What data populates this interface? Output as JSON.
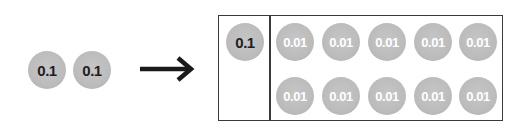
{
  "left_group": {
    "disks": [
      {
        "label": "0.1"
      },
      {
        "label": "0.1"
      }
    ]
  },
  "arrow": {
    "icon": "right-arrow-icon",
    "meaning": "regroup"
  },
  "box": {
    "left_cell": {
      "disks": [
        {
          "label": "0.1"
        }
      ]
    },
    "right_cell": {
      "rows": [
        [
          {
            "label": "0.01"
          },
          {
            "label": "0.01"
          },
          {
            "label": "0.01"
          },
          {
            "label": "0.01"
          },
          {
            "label": "0.01"
          }
        ],
        [
          {
            "label": "0.01"
          },
          {
            "label": "0.01"
          },
          {
            "label": "0.01"
          },
          {
            "label": "0.01"
          },
          {
            "label": "0.01"
          }
        ]
      ]
    }
  },
  "colors": {
    "disk_fill": "#bcbcbc",
    "tenth_text": "#1e1e1e",
    "hundredth_text": "#ffffff",
    "border": "#3a3a3a",
    "arrow": "#1a1a1a"
  }
}
